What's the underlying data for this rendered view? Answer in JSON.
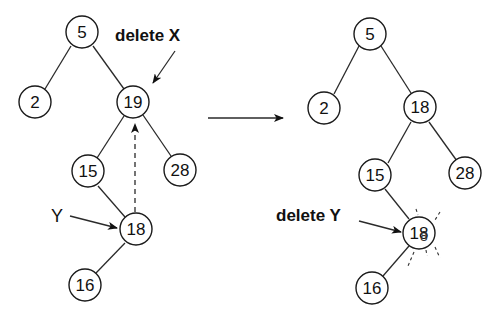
{
  "diagram": {
    "type": "binary-search-tree-deletion",
    "before": {
      "annotation_delete": "delete X",
      "annotation_y": "Y",
      "nodes": [
        {
          "id": "n5",
          "label": "5"
        },
        {
          "id": "n2",
          "label": "2"
        },
        {
          "id": "n19",
          "label": "19"
        },
        {
          "id": "n15",
          "label": "15"
        },
        {
          "id": "n28",
          "label": "28"
        },
        {
          "id": "n18",
          "label": "18"
        },
        {
          "id": "n16",
          "label": "16"
        }
      ],
      "edges": [
        [
          "5",
          "2"
        ],
        [
          "5",
          "19"
        ],
        [
          "19",
          "15"
        ],
        [
          "19",
          "28"
        ],
        [
          "15",
          "18"
        ],
        [
          "18",
          "16"
        ]
      ]
    },
    "transition_arrow": "right-arrow",
    "after": {
      "annotation_delete": "delete Y",
      "nodes": [
        {
          "id": "m5",
          "label": "5"
        },
        {
          "id": "m2",
          "label": "2"
        },
        {
          "id": "m18",
          "label": "18"
        },
        {
          "id": "m15",
          "label": "15"
        },
        {
          "id": "m28",
          "label": "28"
        },
        {
          "id": "m18del",
          "label": "18",
          "overstrike": "8",
          "state": "deleted"
        },
        {
          "id": "m16",
          "label": "16"
        }
      ],
      "edges": [
        [
          "5",
          "2"
        ],
        [
          "5",
          "18"
        ],
        [
          "18",
          "15"
        ],
        [
          "18",
          "28"
        ],
        [
          "15",
          "18del"
        ],
        [
          "18del",
          "16"
        ]
      ]
    }
  }
}
